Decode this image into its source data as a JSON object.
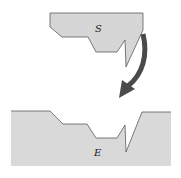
{
  "diagram": {
    "shapes": [
      {
        "id": "S",
        "label": "S",
        "fill": "#d6d6d6",
        "stroke": "#555555"
      },
      {
        "id": "E",
        "label": "E",
        "fill": "#d9d9d9",
        "stroke": "#555555"
      }
    ],
    "arrow": {
      "from": "S",
      "to": "E",
      "color": "#4a4a4a",
      "style": "curved"
    }
  }
}
